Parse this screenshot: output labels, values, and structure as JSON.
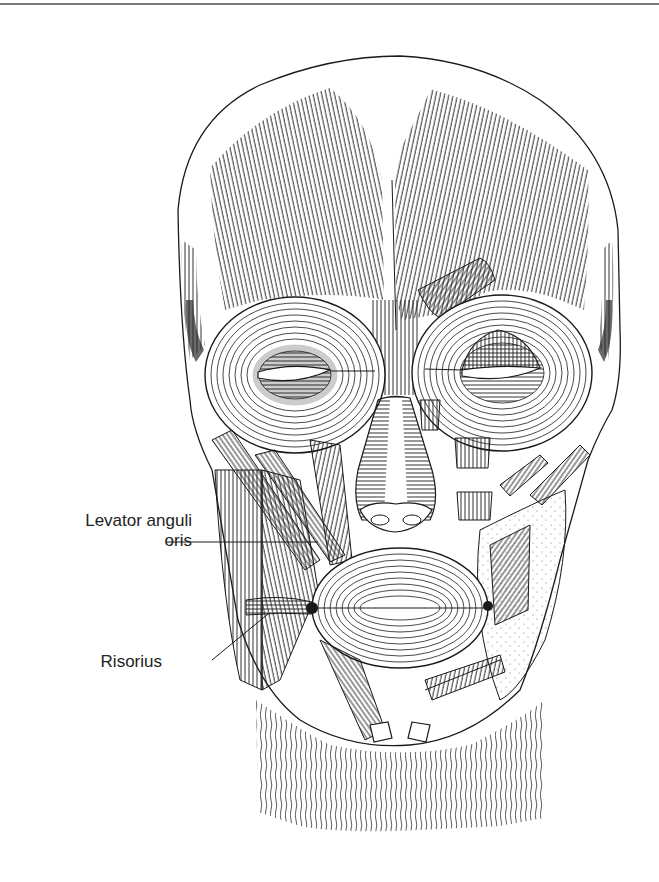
{
  "figure": {
    "rule_color": "#7a7a7a",
    "ink_color": "#1a1a1a",
    "background": "#ffffff"
  },
  "labels": [
    {
      "id": "levator",
      "line1": "Levator anguli",
      "line2": "oris",
      "leader": {
        "x1": 166,
        "y1": 542,
        "x2": 318,
        "y2": 542
      }
    },
    {
      "id": "risorius",
      "line1": "Risorius",
      "leader": {
        "x1": 212,
        "y1": 660,
        "x2": 268,
        "y2": 614
      }
    }
  ]
}
